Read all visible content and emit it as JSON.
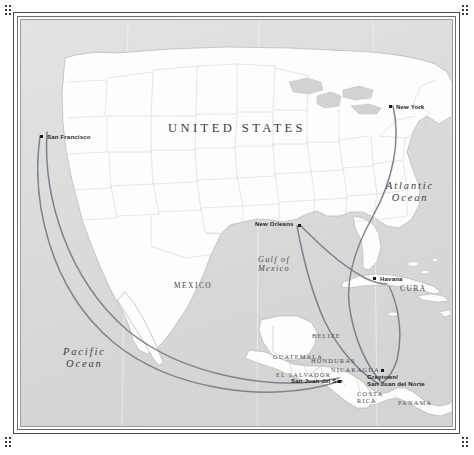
{
  "figure": {
    "kind": "historical-route-map",
    "region": "North America, Gulf of Mexico and Central America"
  },
  "colors": {
    "ocean": "#dcdcdc",
    "land": "#fdfdfd",
    "land_outline": "#b9b9b9",
    "state_border": "#cfcfcf",
    "route": "#6f7d8c",
    "frame": "#4a4a4a",
    "label": "#2f2f2f",
    "lake": "#d6d6d6"
  },
  "title": {
    "text": "UNITED STATES",
    "x": 168,
    "y": 121
  },
  "water_labels": [
    {
      "name": "pacific-ocean",
      "lines": [
        "Pacific",
        "Ocean"
      ],
      "x": 63,
      "y": 346,
      "size": "lg"
    },
    {
      "name": "atlantic-ocean",
      "lines": [
        "Atlantic",
        "Ocean"
      ],
      "x": 386,
      "y": 180,
      "size": "lg"
    },
    {
      "name": "gulf-of-mexico",
      "lines": [
        "Gulf of",
        "Mexico"
      ],
      "x": 258,
      "y": 255,
      "size": "sm"
    }
  ],
  "country_labels": [
    {
      "name": "mexico",
      "text": "MEXICO",
      "x": 174,
      "y": 282,
      "size": "lg"
    },
    {
      "name": "cuba",
      "text": "CUBA",
      "x": 400,
      "y": 285,
      "size": "lg"
    },
    {
      "name": "belize",
      "text": "BELIZE",
      "x": 312,
      "y": 332,
      "size": "sm"
    },
    {
      "name": "guatemala",
      "text": "GUATEMALA",
      "x": 273,
      "y": 353,
      "size": "sm"
    },
    {
      "name": "honduras",
      "text": "HONDURAS",
      "x": 311,
      "y": 357,
      "size": "sm"
    },
    {
      "name": "el-salvador",
      "text": "EL SALVADOR",
      "x": 276,
      "y": 371,
      "size": "sm"
    },
    {
      "name": "nicaragua",
      "text": "NICARAGUA",
      "x": 331,
      "y": 366,
      "size": "sm"
    },
    {
      "name": "costa-rica",
      "text": "COSTA RICA",
      "x": 357,
      "y": 390,
      "size": "sm"
    },
    {
      "name": "panama",
      "text": "PANAMA",
      "x": 398,
      "y": 399,
      "size": "sm"
    }
  ],
  "cities": [
    {
      "name": "san-francisco",
      "lines": [
        "San Francisco"
      ],
      "label_x": 47,
      "label_y": 134,
      "dot_x": 40,
      "dot_y": 135,
      "dot_side": "left"
    },
    {
      "name": "new-york",
      "lines": [
        "New York"
      ],
      "label_x": 396,
      "label_y": 104,
      "dot_x": 389,
      "dot_y": 105,
      "dot_side": "left"
    },
    {
      "name": "new-orleans",
      "lines": [
        "New Orleans"
      ],
      "label_x": 255,
      "label_y": 221,
      "dot_x": 298,
      "dot_y": 224,
      "dot_side": "right"
    },
    {
      "name": "havana",
      "lines": [
        "Havana"
      ],
      "label_x": 380,
      "label_y": 276,
      "dot_x": 373,
      "dot_y": 277,
      "dot_side": "left"
    },
    {
      "name": "san-juan-del-sur",
      "lines": [
        "San Juan del Sur"
      ],
      "label_x": 291,
      "label_y": 378,
      "dot_x": 338,
      "dot_y": 380,
      "dot_side": "right"
    },
    {
      "name": "greytown-san-juan-del-norte",
      "lines": [
        "Greytown/",
        "San Juan del Norte"
      ],
      "label_x": 367,
      "label_y": 373,
      "dot_x": 381,
      "dot_y": 369,
      "dot_side": "above"
    }
  ],
  "routes": [
    {
      "name": "pacific-route-outer",
      "from": "San Francisco",
      "to": "San Juan del Sur"
    },
    {
      "name": "pacific-route-inner",
      "from": "San Francisco",
      "to": "San Juan del Sur"
    },
    {
      "name": "atlantic-route-new-york",
      "from": "New York",
      "to": "Greytown/San Juan del Norte"
    },
    {
      "name": "gulf-route-new-orleans",
      "from": "New Orleans",
      "to": "Havana"
    },
    {
      "name": "gulf-route-new-orleans-2",
      "from": "New Orleans",
      "to": "Greytown/San Juan del Norte"
    },
    {
      "name": "havana-greytown-route",
      "from": "Havana",
      "to": "Greytown/San Juan del Norte"
    }
  ]
}
